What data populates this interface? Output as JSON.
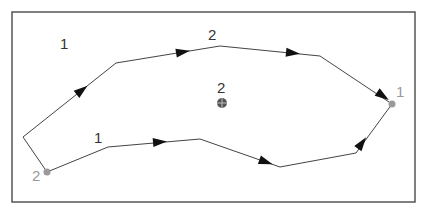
{
  "diagram": {
    "frame": {
      "x": 12,
      "y": 12,
      "width": 403,
      "height": 190,
      "stroke": "#555555"
    },
    "colors": {
      "path": "#444444",
      "arrow": "#111111",
      "label_dark": "#333333",
      "label_gray": "#999999",
      "endpoint": "#9a9a9a",
      "center_marker": "#555555"
    },
    "endpoints": [
      {
        "id": "start",
        "label": "2",
        "x": 47,
        "y": 172
      },
      {
        "id": "end",
        "label": "1",
        "x": 392,
        "y": 104
      }
    ],
    "center_marker": {
      "label": "2",
      "x": 222,
      "y": 103,
      "icon": "crosshair-circle-icon"
    },
    "paths": [
      {
        "id": "path-2",
        "label": "2",
        "points": [
          [
            47,
            172
          ],
          [
            23,
            137
          ],
          [
            116,
            63
          ],
          [
            220,
            46
          ],
          [
            320,
            56
          ],
          [
            392,
            104
          ]
        ],
        "arrows": [
          [
            82,
            90
          ],
          [
            183,
            52
          ],
          [
            293,
            53
          ],
          [
            383,
            96
          ]
        ]
      },
      {
        "id": "path-1",
        "label": "1",
        "points": [
          [
            47,
            172
          ],
          [
            108,
            147
          ],
          [
            200,
            139
          ],
          [
            280,
            167
          ],
          [
            356,
            153
          ],
          [
            392,
            104
          ]
        ],
        "arrows": [
          [
            160,
            142
          ],
          [
            266,
            162
          ],
          [
            362,
            143
          ]
        ]
      }
    ],
    "region_labels": [
      {
        "id": "region-label-top-left",
        "text": "1",
        "x": 60,
        "y": 36,
        "color": "dark"
      },
      {
        "id": "path-label-upper",
        "text": "2",
        "x": 208,
        "y": 27,
        "color": "dark"
      },
      {
        "id": "path-label-lower",
        "text": "1",
        "x": 94,
        "y": 130,
        "color": "dark"
      },
      {
        "id": "center-label",
        "text": "2",
        "x": 217,
        "y": 80,
        "color": "dark"
      },
      {
        "id": "endpoint-label-start",
        "text": "2",
        "x": 32,
        "y": 168,
        "color": "gray"
      },
      {
        "id": "endpoint-label-end",
        "text": "1",
        "x": 396,
        "y": 84,
        "color": "gray"
      }
    ]
  }
}
